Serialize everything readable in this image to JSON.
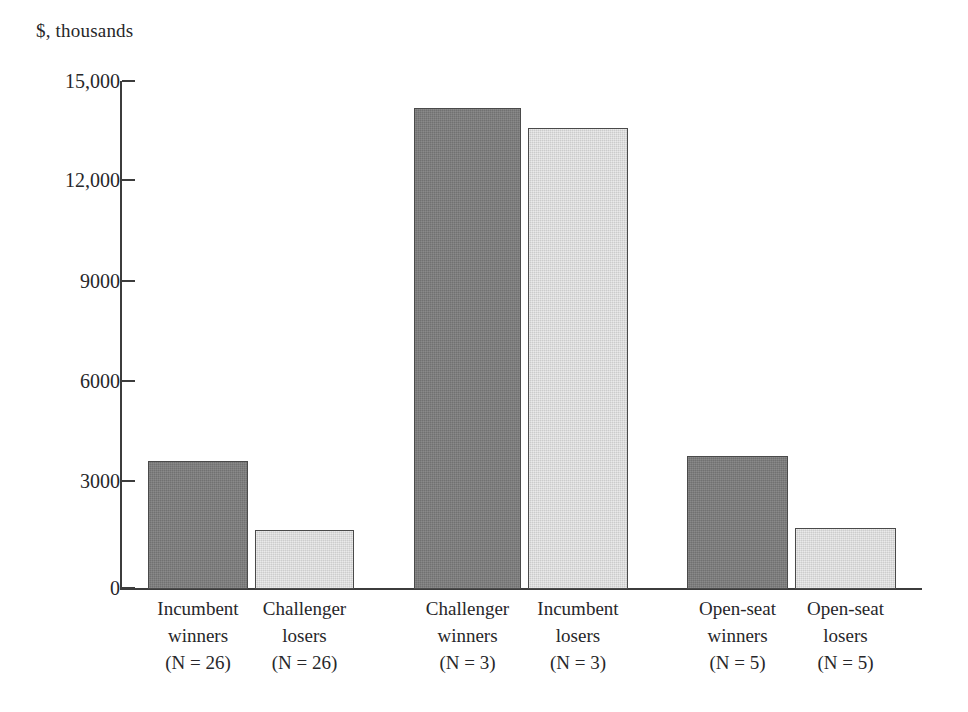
{
  "chart_data": {
    "type": "bar",
    "title": "",
    "subtitle": "",
    "xlabel": "",
    "ylabel": "$, thousands",
    "unit_label": "$, thousands",
    "ylim": [
      0,
      15000
    ],
    "grid": false,
    "legend": false,
    "legend_position": "none",
    "y_ticks": [
      {
        "value": 15000,
        "label": "15,000"
      },
      {
        "value": 12000,
        "label": "12,000"
      },
      {
        "value": 9000,
        "label": "9000"
      },
      {
        "value": 6000,
        "label": "6000"
      },
      {
        "value": 3000,
        "label": "3000"
      },
      {
        "value": 0,
        "label": "0"
      }
    ],
    "categories": [
      "Incumbent winners\n(N = 26)",
      "Challenger losers\n(N = 26)",
      "Challenger winners\n(N = 3)",
      "Incumbent losers\n(N = 3)",
      "Open-seat winners\n(N = 5)",
      "Open-seat losers\n(N = 5)"
    ],
    "values": [
      3780,
      1740,
      14200,
      13600,
      3930,
      1800
    ],
    "bars": [
      {
        "line1": "Incumbent",
        "line2": "winners",
        "line3": "(N = 26)",
        "value": 3780,
        "style": "dark",
        "group": 1
      },
      {
        "line1": "Challenger",
        "line2": "losers",
        "line3": "(N = 26)",
        "value": 1740,
        "style": "light",
        "group": 1
      },
      {
        "line1": "Challenger",
        "line2": "winners",
        "line3": "(N = 3)",
        "value": 14200,
        "style": "dark",
        "group": 2
      },
      {
        "line1": "Incumbent",
        "line2": "losers",
        "line3": "(N = 3)",
        "value": 13600,
        "style": "light",
        "group": 2
      },
      {
        "line1": "Open-seat",
        "line2": "winners",
        "line3": "(N = 5)",
        "value": 3930,
        "style": "dark",
        "group": 3
      },
      {
        "line1": "Open-seat",
        "line2": "losers",
        "line3": "(N = 5)",
        "value": 1800,
        "style": "light",
        "group": 3
      }
    ],
    "colors": {
      "dark_bar": "#7d7d7d",
      "light_bar": "#d9d9d9",
      "bar_border": "#4a4a4a",
      "axis": "#3c3c3c",
      "text": "#27272a",
      "background": "#ffffff"
    }
  },
  "layout": {
    "bar_pixels": [
      {
        "left": 148,
        "width": 100,
        "top": 461
      },
      {
        "left": 255,
        "width": 99,
        "top": 530
      },
      {
        "left": 414,
        "width": 107,
        "top": 108
      },
      {
        "left": 528,
        "width": 100,
        "top": 128
      },
      {
        "left": 687,
        "width": 101,
        "top": 456
      },
      {
        "left": 795,
        "width": 101,
        "top": 528
      }
    ],
    "tick_pixels": [
      81,
      180,
      281,
      381,
      481,
      588
    ],
    "baseline_y": 589,
    "label_tops": [
      596,
      596,
      596,
      596,
      596,
      596
    ]
  }
}
